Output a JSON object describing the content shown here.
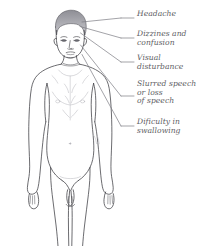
{
  "diagram": {
    "colors": {
      "background": "#ffffff",
      "outline": "#3b3b40",
      "shading": "#9b9ba1",
      "text": "#5d5d63",
      "leader_line": "#7b7b82"
    },
    "callouts": [
      {
        "id": "headache",
        "text": "Headache",
        "lines": [
          "Headache"
        ],
        "label_y": 14,
        "leader": {
          "x1": 78,
          "y1": 22,
          "x2": 134,
          "y2": 18
        }
      },
      {
        "id": "dizziness-confusion",
        "text": "Dizzines and\nconfusion",
        "lines": [
          "Dizzines and",
          "confusion"
        ],
        "label_y": 29,
        "leader": {
          "x1": 79,
          "y1": 26,
          "x2": 134,
          "y2": 38
        }
      },
      {
        "id": "visual-disturbance",
        "text": "Visual\ndisturbance",
        "lines": [
          "Visual",
          "disturbance"
        ],
        "label_y": 53,
        "leader": {
          "x1": 80,
          "y1": 33,
          "x2": 134,
          "y2": 62
        }
      },
      {
        "id": "slurred-speech",
        "text": "Slurred speech\nor loss\nof speech",
        "lines": [
          "Slurred speech",
          "or loss",
          "of speech"
        ],
        "label_y": 79,
        "leader": {
          "x1": 81,
          "y1": 46,
          "x2": 134,
          "y2": 96
        }
      },
      {
        "id": "difficulty-swallowing",
        "text": "Dificulty in\nswallowing",
        "lines": [
          "Dificulty in",
          "swallowing"
        ],
        "label_y": 117,
        "leader": {
          "x1": 83,
          "y1": 54,
          "x2": 134,
          "y2": 126
        }
      }
    ]
  }
}
